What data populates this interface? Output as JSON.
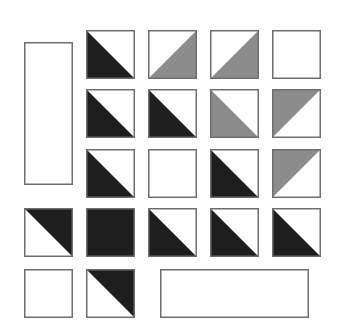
{
  "colors": {
    "black": "#1e1e1e",
    "gray": "#8c8c8c",
    "white": "#ffffff",
    "stroke": "#6e6e6e"
  },
  "rects": [
    {
      "name": "tall-rectangle",
      "x": 24,
      "y": 42,
      "w": 49,
      "h": 143
    },
    {
      "name": "wide-rectangle",
      "x": 160,
      "y": 269,
      "w": 149,
      "h": 49
    }
  ],
  "tiles": [
    {
      "row": 1,
      "col": 2,
      "x": 86,
      "y": 30,
      "fill": "black",
      "part": "lower-left"
    },
    {
      "row": 1,
      "col": 3,
      "x": 148,
      "y": 30,
      "fill": "gray",
      "part": "lower-right"
    },
    {
      "row": 1,
      "col": 4,
      "x": 210,
      "y": 30,
      "fill": "gray",
      "part": "lower-right"
    },
    {
      "row": 1,
      "col": 5,
      "x": 272,
      "y": 30,
      "fill": "white",
      "part": "none"
    },
    {
      "row": 2,
      "col": 2,
      "x": 86,
      "y": 89,
      "fill": "black",
      "part": "lower-left"
    },
    {
      "row": 2,
      "col": 3,
      "x": 148,
      "y": 89,
      "fill": "black",
      "part": "lower-left"
    },
    {
      "row": 2,
      "col": 4,
      "x": 210,
      "y": 89,
      "fill": "gray",
      "part": "lower-left"
    },
    {
      "row": 2,
      "col": 5,
      "x": 272,
      "y": 89,
      "fill": "gray",
      "part": "upper-left"
    },
    {
      "row": 3,
      "col": 2,
      "x": 86,
      "y": 149,
      "fill": "black",
      "part": "lower-left"
    },
    {
      "row": 3,
      "col": 3,
      "x": 148,
      "y": 149,
      "fill": "white",
      "part": "none"
    },
    {
      "row": 3,
      "col": 4,
      "x": 210,
      "y": 149,
      "fill": "black",
      "part": "lower-left"
    },
    {
      "row": 3,
      "col": 5,
      "x": 272,
      "y": 149,
      "fill": "gray",
      "part": "upper-left"
    },
    {
      "row": 4,
      "col": 1,
      "x": 24,
      "y": 208,
      "fill": "black",
      "part": "upper-right"
    },
    {
      "row": 4,
      "col": 2,
      "x": 86,
      "y": 208,
      "fill": "black",
      "part": "full"
    },
    {
      "row": 4,
      "col": 3,
      "x": 148,
      "y": 208,
      "fill": "black",
      "part": "lower-left"
    },
    {
      "row": 4,
      "col": 4,
      "x": 210,
      "y": 208,
      "fill": "black",
      "part": "lower-left"
    },
    {
      "row": 4,
      "col": 5,
      "x": 272,
      "y": 208,
      "fill": "black",
      "part": "lower-left"
    },
    {
      "row": 5,
      "col": 1,
      "x": 24,
      "y": 269,
      "fill": "white",
      "part": "none"
    },
    {
      "row": 5,
      "col": 2,
      "x": 86,
      "y": 269,
      "fill": "black",
      "part": "upper-right"
    }
  ],
  "tile_size": 49
}
